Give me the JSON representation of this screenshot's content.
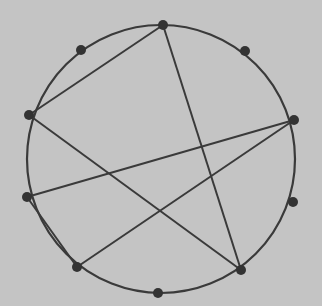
{
  "colors": {
    "background": "#c4c4c4",
    "stroke": "#3a3a3a",
    "node": "#333333"
  },
  "circle": {
    "cx": 161,
    "cy": 159,
    "r": 134
  },
  "nodes": [
    {
      "id": "n0",
      "x": 163,
      "y": 25
    },
    {
      "id": "n1",
      "x": 81,
      "y": 50
    },
    {
      "id": "n2",
      "x": 245,
      "y": 51
    },
    {
      "id": "n3",
      "x": 29,
      "y": 115
    },
    {
      "id": "n4",
      "x": 294,
      "y": 120
    },
    {
      "id": "n5",
      "x": 27,
      "y": 197
    },
    {
      "id": "n6",
      "x": 293,
      "y": 202
    },
    {
      "id": "n7",
      "x": 77,
      "y": 267
    },
    {
      "id": "n8",
      "x": 241,
      "y": 270
    },
    {
      "id": "n9",
      "x": 158,
      "y": 293
    }
  ],
  "edges": [
    [
      "n0",
      "n3"
    ],
    [
      "n0",
      "n8"
    ],
    [
      "n3",
      "n8"
    ],
    [
      "n4",
      "n5"
    ],
    [
      "n4",
      "n7"
    ],
    [
      "n5",
      "n7"
    ]
  ]
}
